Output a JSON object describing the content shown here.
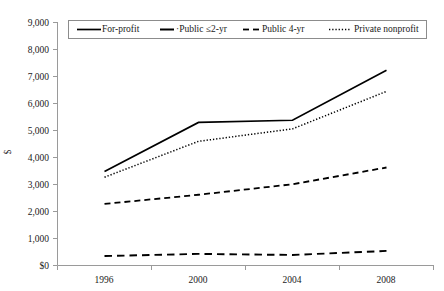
{
  "chart_data": {
    "type": "line",
    "title": "",
    "subtitle": "",
    "xlabel": "",
    "ylabel": "$",
    "x": [
      "1996",
      "2000",
      "2004",
      "2008"
    ],
    "categories": [
      "1996",
      "2000",
      "2004",
      "2008"
    ],
    "series": [
      {
        "name": "For-profit",
        "style": "solid",
        "values": [
          3480,
          5300,
          5380,
          7230
        ]
      },
      {
        "name": "·Public ≤2-yr",
        "style": "long-dash",
        "values": [
          350,
          430,
          390,
          540
        ]
      },
      {
        "name": "Public 4-yr",
        "style": "dashed",
        "values": [
          2280,
          2620,
          3010,
          3630
        ]
      },
      {
        "name": "Private nonprofit",
        "style": "dotted",
        "values": [
          3270,
          4600,
          5060,
          6450
        ]
      }
    ],
    "ylim": [
      0,
      9000
    ],
    "ytick_values": [
      0,
      1000,
      2000,
      3000,
      4000,
      5000,
      6000,
      7000,
      8000,
      9000
    ],
    "ytick_labels": [
      "$0",
      "1,000",
      "2,000",
      "3,000",
      "4,000",
      "5,000",
      "6,000",
      "7,000",
      "8,000",
      "9,000"
    ],
    "xtick_labels": [
      "1996",
      "2000",
      "2004",
      "2008"
    ],
    "grid": false,
    "legend_position": "top-inside",
    "legend": [
      {
        "label": "For-profit",
        "style": "solid"
      },
      {
        "label": "·Public ≤2-yr",
        "style": "long-dash"
      },
      {
        "label": "Public 4-yr",
        "style": "dashed"
      },
      {
        "label": "Private nonprofit",
        "style": "dotted"
      }
    ],
    "colors": {
      "series": "#000000",
      "axis": "#9a9a9a",
      "text": "#1a1a1a",
      "background": "#ffffff",
      "legend_border": "#8c8c8c"
    }
  }
}
